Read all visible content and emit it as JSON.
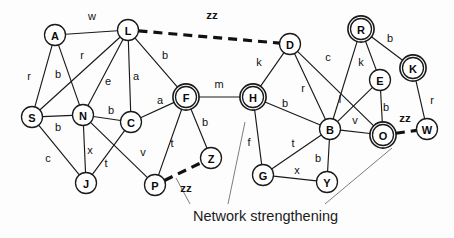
{
  "figure": {
    "caption": "Network strengthening",
    "width": 454,
    "height": 238,
    "background_color": "#fdfdfd",
    "edge_color": "#1a1a1a",
    "dashed_edge_color": "#111111",
    "pointer_color": "#7d7d7d"
  },
  "chart_data": {
    "type": "diagram",
    "subtype": "node-link-network-graph",
    "title": "Network strengthening",
    "node_count": 20,
    "edge_count": 35,
    "highlighted_node_count": 5,
    "dashed_edge_count": 3,
    "legend": [
      {
        "style": "solid-thin",
        "meaning": "existing network link"
      },
      {
        "style": "dashed-thick",
        "meaning": "new strengthening link (zz)"
      },
      {
        "style": "double-ring-node",
        "meaning": "highlighted hub node"
      }
    ],
    "nodes": [
      {
        "id": "A",
        "x": 55,
        "y": 35,
        "highlighted": false
      },
      {
        "id": "L",
        "x": 128,
        "y": 30,
        "highlighted": false
      },
      {
        "id": "S",
        "x": 32,
        "y": 117,
        "highlighted": false
      },
      {
        "id": "N",
        "x": 83,
        "y": 115,
        "highlighted": false
      },
      {
        "id": "C",
        "x": 131,
        "y": 122,
        "highlighted": false
      },
      {
        "id": "J",
        "x": 86,
        "y": 183,
        "highlighted": false
      },
      {
        "id": "F",
        "x": 186,
        "y": 97,
        "highlighted": true
      },
      {
        "id": "Z",
        "x": 211,
        "y": 158,
        "highlighted": false
      },
      {
        "id": "P",
        "x": 155,
        "y": 185,
        "highlighted": false
      },
      {
        "id": "H",
        "x": 253,
        "y": 97,
        "highlighted": true
      },
      {
        "id": "D",
        "x": 290,
        "y": 44,
        "highlighted": false
      },
      {
        "id": "G",
        "x": 263,
        "y": 175,
        "highlighted": false
      },
      {
        "id": "Y",
        "x": 327,
        "y": 182,
        "highlighted": false
      },
      {
        "id": "B",
        "x": 330,
        "y": 129,
        "highlighted": false
      },
      {
        "id": "R",
        "x": 361,
        "y": 29,
        "highlighted": true
      },
      {
        "id": "E",
        "x": 380,
        "y": 80,
        "highlighted": false
      },
      {
        "id": "O",
        "x": 383,
        "y": 135,
        "highlighted": true
      },
      {
        "id": "K",
        "x": 413,
        "y": 68,
        "highlighted": true
      },
      {
        "id": "W",
        "x": 427,
        "y": 129,
        "highlighted": false
      }
    ],
    "edges": [
      {
        "source": "A",
        "target": "L",
        "label": "w",
        "dashed": false,
        "lx": 92,
        "ly": 16
      },
      {
        "source": "A",
        "target": "S",
        "label": "r",
        "dashed": false,
        "lx": 29,
        "ly": 76
      },
      {
        "source": "A",
        "target": "N",
        "label": "b",
        "dashed": false,
        "lx": 58,
        "ly": 74
      },
      {
        "source": "L",
        "target": "S",
        "label": "r",
        "dashed": false,
        "lx": 82,
        "ly": 55
      },
      {
        "source": "L",
        "target": "N",
        "label": "e",
        "dashed": false,
        "lx": 108,
        "ly": 81
      },
      {
        "source": "L",
        "target": "C",
        "label": "a",
        "dashed": false,
        "lx": 136,
        "ly": 76
      },
      {
        "source": "L",
        "target": "F",
        "label": "b",
        "dashed": false,
        "lx": 165,
        "ly": 55
      },
      {
        "source": "L",
        "target": "D",
        "label": "zz",
        "dashed": true,
        "lx": 212,
        "ly": 15
      },
      {
        "source": "S",
        "target": "N",
        "label": "b",
        "dashed": false,
        "lx": 58,
        "ly": 127
      },
      {
        "source": "S",
        "target": "J",
        "label": "c",
        "dashed": false,
        "lx": 48,
        "ly": 158
      },
      {
        "source": "N",
        "target": "C",
        "label": "b",
        "dashed": false,
        "lx": 111,
        "ly": 110
      },
      {
        "source": "N",
        "target": "J",
        "label": "x",
        "dashed": false,
        "lx": 90,
        "ly": 150
      },
      {
        "source": "N",
        "target": "P",
        "label": "v",
        "dashed": false,
        "lx": 143,
        "ly": 152
      },
      {
        "source": "C",
        "target": "J",
        "label": "t",
        "dashed": false,
        "lx": 106,
        "ly": 163
      },
      {
        "source": "C",
        "target": "F",
        "label": "a",
        "dashed": false,
        "lx": 160,
        "ly": 100
      },
      {
        "source": "F",
        "target": "Z",
        "label": "b",
        "dashed": false,
        "lx": 205,
        "ly": 122
      },
      {
        "source": "F",
        "target": "P",
        "label": "t",
        "dashed": false,
        "lx": 172,
        "ly": 143
      },
      {
        "source": "F",
        "target": "H",
        "label": "m",
        "dashed": false,
        "lx": 219,
        "ly": 84
      },
      {
        "source": "P",
        "target": "Z",
        "label": "zz",
        "dashed": true,
        "lx": 186,
        "ly": 188
      },
      {
        "source": "H",
        "target": "D",
        "label": "k",
        "dashed": false,
        "lx": 259,
        "ly": 62
      },
      {
        "source": "H",
        "target": "B",
        "label": "b",
        "dashed": false,
        "lx": 285,
        "ly": 103
      },
      {
        "source": "H",
        "target": "G",
        "label": "f",
        "dashed": false,
        "lx": 249,
        "ly": 142
      },
      {
        "source": "D",
        "target": "B",
        "label": "r",
        "dashed": false,
        "lx": 303,
        "ly": 88
      },
      {
        "source": "D",
        "target": "O",
        "label": "c",
        "dashed": false,
        "lx": 328,
        "ly": 57
      },
      {
        "source": "R",
        "target": "E",
        "label": "k",
        "dashed": false,
        "lx": 361,
        "ly": 62
      },
      {
        "source": "R",
        "target": "K",
        "label": "b",
        "dashed": false,
        "lx": 390,
        "ly": 38
      },
      {
        "source": "R",
        "target": "B",
        "label": "",
        "dashed": false,
        "lx": 0,
        "ly": 0
      },
      {
        "source": "E",
        "target": "B",
        "label": "l",
        "dashed": false,
        "lx": 340,
        "ly": 99
      },
      {
        "source": "E",
        "target": "O",
        "label": "b",
        "dashed": false,
        "lx": 386,
        "ly": 107
      },
      {
        "source": "B",
        "target": "O",
        "label": "v",
        "dashed": false,
        "lx": 355,
        "ly": 120
      },
      {
        "source": "B",
        "target": "G",
        "label": "t",
        "dashed": false,
        "lx": 293,
        "ly": 143
      },
      {
        "source": "B",
        "target": "Y",
        "label": "b",
        "dashed": false,
        "lx": 318,
        "ly": 158
      },
      {
        "source": "G",
        "target": "Y",
        "label": "x",
        "dashed": false,
        "lx": 297,
        "ly": 170
      },
      {
        "source": "K",
        "target": "W",
        "label": "r",
        "dashed": false,
        "lx": 432,
        "ly": 100
      },
      {
        "source": "O",
        "target": "W",
        "label": "zz",
        "dashed": true,
        "lx": 405,
        "ly": 118
      }
    ],
    "pointers": [
      {
        "x1": 176,
        "y1": 178,
        "x2": 190,
        "y2": 204
      },
      {
        "x1": 245,
        "y1": 122,
        "x2": 228,
        "y2": 204
      },
      {
        "x1": 392,
        "y1": 148,
        "x2": 325,
        "y2": 204
      }
    ],
    "caption": {
      "text": "Network strengthening",
      "x": 193,
      "y": 208
    }
  }
}
